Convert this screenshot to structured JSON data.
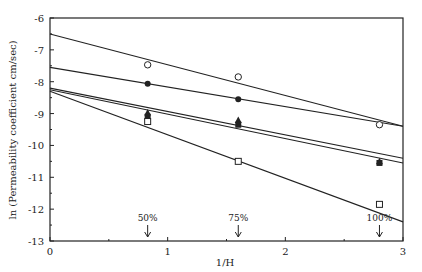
{
  "chart_data": {
    "type": "scatter",
    "title": "",
    "xlabel": "1/H",
    "ylabel": "ln (Permeability coefficient cm/sec)",
    "xlim": [
      0,
      3
    ],
    "ylim": [
      -13,
      -6
    ],
    "xticks": [
      0,
      1,
      2,
      3
    ],
    "yticks": [
      -6,
      -7,
      -8,
      -9,
      -10,
      -11,
      -12,
      -13
    ],
    "grid": false,
    "legend": null,
    "annotations": [
      {
        "text": "50%",
        "x": 0.83,
        "arrow": "down"
      },
      {
        "text": "75%",
        "x": 1.6,
        "arrow": "down"
      },
      {
        "text": "100%",
        "x": 2.8,
        "arrow": "down"
      }
    ],
    "series": [
      {
        "name": "open-circle",
        "marker": "open-circle",
        "x": [
          0.83,
          1.6,
          2.8
        ],
        "y": [
          -7.47,
          -7.85,
          -9.35
        ],
        "fit_line": {
          "x0": 0,
          "y0": -6.5,
          "x1": 3,
          "y1": -9.4
        }
      },
      {
        "name": "filled-circle",
        "marker": "filled-circle",
        "x": [
          0.83,
          1.6
        ],
        "y": [
          -8.06,
          -8.55
        ],
        "fit_line": {
          "x0": 0,
          "y0": -7.55,
          "x1": 3,
          "y1": -9.4
        }
      },
      {
        "name": "filled-triangle",
        "marker": "filled-triangle",
        "x": [
          0.83,
          1.6,
          2.8
        ],
        "y": [
          -8.97,
          -9.2,
          -10.5
        ],
        "fit_line": {
          "x0": 0,
          "y0": -8.2,
          "x1": 3,
          "y1": -10.4
        }
      },
      {
        "name": "filled-square",
        "marker": "filled-square",
        "x": [
          0.83,
          1.6,
          2.8
        ],
        "y": [
          -9.1,
          -9.35,
          -10.55
        ],
        "fit_line": {
          "x0": 0,
          "y0": -8.25,
          "x1": 3,
          "y1": -10.55
        }
      },
      {
        "name": "open-square",
        "marker": "open-square",
        "x": [
          0.83,
          1.6,
          2.8
        ],
        "y": [
          -9.25,
          -10.5,
          -11.85
        ],
        "fit_line": {
          "x0": 0,
          "y0": -8.3,
          "x1": 3,
          "y1": -12.4
        }
      }
    ]
  },
  "layout": {
    "plot_left": 50,
    "plot_right": 403,
    "plot_top": 18,
    "plot_bottom": 241,
    "ink": "#222222"
  }
}
